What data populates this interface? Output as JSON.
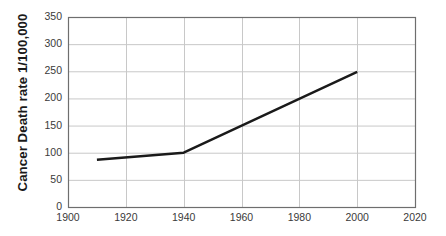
{
  "chart_data": {
    "type": "line",
    "title": "",
    "xlabel": "",
    "ylabel": "Cancer Death rate 1/100,000",
    "x": [
      1910,
      1940,
      2000
    ],
    "values": [
      87,
      100,
      249
    ],
    "series": [
      {
        "name": "Cancer Death rate",
        "x": [
          1910,
          1940,
          2000
        ],
        "values": [
          87,
          100,
          249
        ],
        "color": "#1a1a1a"
      }
    ],
    "xlim": [
      1900,
      2020
    ],
    "ylim": [
      0,
      350
    ],
    "xticks": [
      1900,
      1920,
      1940,
      1960,
      1980,
      2000,
      2020
    ],
    "xtick_labels": [
      "1900",
      "1920",
      "1940",
      "1960",
      "1980",
      "2000",
      "2020"
    ],
    "yticks": [
      0,
      50,
      100,
      150,
      200,
      250,
      300,
      350
    ],
    "ytick_labels": [
      "0",
      "50",
      "100",
      "150",
      "200",
      "250",
      "300",
      "350"
    ],
    "grid": true,
    "grid_color": "#c8c8c8",
    "axis_color": "#6e6e6e",
    "legend": "none",
    "background": "#ffffff"
  }
}
